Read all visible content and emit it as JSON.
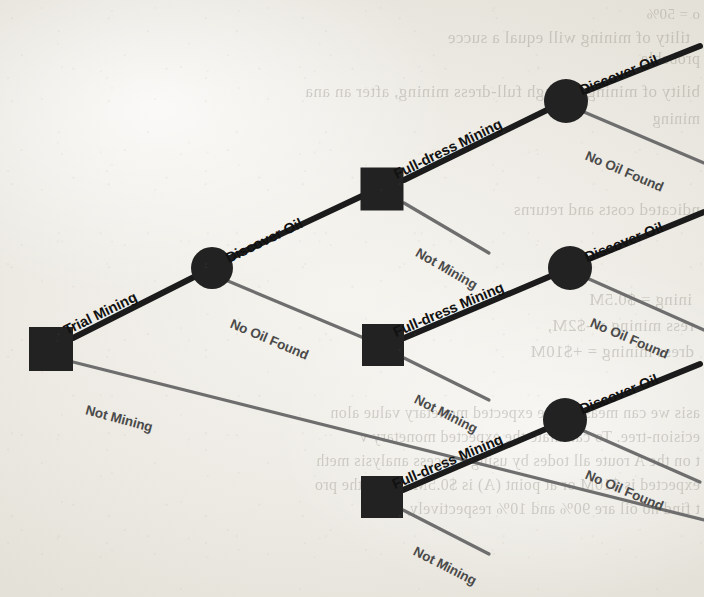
{
  "figure": {
    "type": "decision-tree",
    "medium": "scanned-book-page",
    "background_color": "#efece6",
    "bold_line_color": "#1b1b1b",
    "light_line_color": "#6e6e6e",
    "node_color": "#222222"
  },
  "labels": {
    "trial_mining": "Trial Mining",
    "not_mining": "Not Mining",
    "full_dress_mining": "Full-dress Mining",
    "discover_oil": "Discover Oil",
    "no_oil_found": "No Oil Found"
  },
  "nodes": [
    {
      "id": "root",
      "kind": "decision",
      "shape": "square",
      "x": 51,
      "y": 349,
      "size": 44
    },
    {
      "id": "chance1",
      "kind": "chance",
      "shape": "circle",
      "x": 212,
      "y": 268,
      "r": 21
    },
    {
      "id": "decisionA",
      "kind": "decision",
      "shape": "square",
      "x": 382,
      "y": 189,
      "size": 43
    },
    {
      "id": "decisionB",
      "kind": "decision",
      "shape": "square",
      "x": 383,
      "y": 345,
      "size": 42
    },
    {
      "id": "decisionC",
      "kind": "decision",
      "shape": "square",
      "x": 382,
      "y": 497,
      "size": 42
    },
    {
      "id": "chanceA",
      "kind": "chance",
      "shape": "circle",
      "x": 566,
      "y": 101,
      "r": 22
    },
    {
      "id": "chanceB",
      "kind": "chance",
      "shape": "circle",
      "x": 570,
      "y": 268,
      "r": 22
    },
    {
      "id": "chanceC",
      "kind": "chance",
      "shape": "circle",
      "x": 565,
      "y": 420,
      "r": 22
    }
  ],
  "edges": [
    {
      "id": "e-root-trial",
      "label": "Trial Mining",
      "weight": "bold",
      "from": "root",
      "to": "chance1",
      "x1": 73,
      "y1": 338,
      "x2": 194,
      "y2": 277
    },
    {
      "id": "e-root-notmine",
      "label": "Not Mining",
      "weight": "light",
      "from": "root",
      "to": "terminal-root-not",
      "x1": 73,
      "y1": 362,
      "x2": 704,
      "y2": 520
    },
    {
      "id": "e-c1-discover",
      "label": "Discover Oil",
      "weight": "bold",
      "from": "chance1",
      "to": "decisionA",
      "x1": 230,
      "y1": 258,
      "x2": 362,
      "y2": 196
    },
    {
      "id": "e-c1-nooil",
      "label": "No Oil Found",
      "weight": "light",
      "from": "chance1",
      "to": "decisionB",
      "x1": 228,
      "y1": 281,
      "x2": 364,
      "y2": 338
    },
    {
      "id": "e-dA-full",
      "label": "Full-dress Mining",
      "weight": "bold",
      "from": "decisionA",
      "to": "chanceA",
      "x1": 404,
      "y1": 180,
      "x2": 547,
      "y2": 110
    },
    {
      "id": "e-dA-not",
      "label": "Not Mining",
      "weight": "light",
      "from": "decisionA",
      "to": "terminal-A-not",
      "x1": 404,
      "y1": 203,
      "x2": 489,
      "y2": 253
    },
    {
      "id": "e-dB-full",
      "label": "Full-dress Mining",
      "weight": "bold",
      "from": "decisionB",
      "to": "chanceB",
      "x1": 404,
      "y1": 338,
      "x2": 551,
      "y2": 276
    },
    {
      "id": "e-dB-not",
      "label": "Not Mining",
      "weight": "light",
      "from": "decisionB",
      "to": "terminal-B-not",
      "x1": 404,
      "y1": 358,
      "x2": 489,
      "y2": 400
    },
    {
      "id": "e-dC-full",
      "label": "Full-dress Mining",
      "weight": "bold",
      "from": "decisionC",
      "to": "chanceC",
      "x1": 403,
      "y1": 490,
      "x2": 546,
      "y2": 429
    },
    {
      "id": "e-dC-not",
      "label": "Not Mining",
      "weight": "light",
      "from": "decisionC",
      "to": "terminal-C-not",
      "x1": 403,
      "y1": 510,
      "x2": 489,
      "y2": 554
    },
    {
      "id": "e-cA-discover",
      "label": "Discover Oil",
      "weight": "bold",
      "from": "chanceA",
      "to": "terminal-A-oil",
      "x1": 584,
      "y1": 92,
      "x2": 700,
      "y2": 46
    },
    {
      "id": "e-cA-nooil",
      "label": "No Oil Found",
      "weight": "light",
      "from": "chanceA",
      "to": "terminal-A-nooil",
      "x1": 584,
      "y1": 112,
      "x2": 704,
      "y2": 163
    },
    {
      "id": "e-cB-discover",
      "label": "Discover Oil",
      "weight": "bold",
      "from": "chanceB",
      "to": "terminal-B-oil",
      "x1": 589,
      "y1": 259,
      "x2": 704,
      "y2": 212
    },
    {
      "id": "e-cB-nooil",
      "label": "No Oil Found",
      "weight": "light",
      "from": "chanceB",
      "to": "terminal-B-nooil",
      "x1": 589,
      "y1": 279,
      "x2": 704,
      "y2": 330
    },
    {
      "id": "e-cC-discover",
      "label": "Discover Oil",
      "weight": "bold",
      "from": "chanceC",
      "to": "terminal-C-oil",
      "x1": 584,
      "y1": 411,
      "x2": 700,
      "y2": 364
    },
    {
      "id": "e-cC-nooil",
      "label": "No Oil Found",
      "weight": "light",
      "from": "chanceC",
      "to": "terminal-C-nooil",
      "x1": 584,
      "y1": 431,
      "x2": 700,
      "y2": 482
    }
  ],
  "bleed_through": [
    {
      "text": "o = 50%",
      "x": 700,
      "y": 6,
      "size": 15
    },
    {
      "text": "tility of mining will equal a succe",
      "x": 690,
      "y": 28,
      "size": 17
    },
    {
      "text": "probable",
      "x": 700,
      "y": 50,
      "size": 16
    },
    {
      "text": "bility of mining through full-dress mining, after an ana",
      "x": 700,
      "y": 82,
      "size": 17
    },
    {
      "text": "mining",
      "x": 700,
      "y": 110,
      "size": 16
    },
    {
      "text": "ndicated costs and returns",
      "x": 700,
      "y": 200,
      "size": 17
    },
    {
      "text": "ining = $0.5M",
      "x": 692,
      "y": 290,
      "size": 17
    },
    {
      "text": "ress mining = -$2M,",
      "x": 694,
      "y": 316,
      "size": 17
    },
    {
      "text": "dress mining = +$10M",
      "x": 694,
      "y": 342,
      "size": 17
    },
    {
      "text": "asis we can measure the expected monetary value alon",
      "x": 700,
      "y": 404,
      "size": 16
    },
    {
      "text": "ecision-tree. To calculate the expected monetary v",
      "x": 700,
      "y": 428,
      "size": 16
    },
    {
      "text": "t on the A route all todes by using a recess analysis meth",
      "x": 700,
      "y": 452,
      "size": 16
    },
    {
      "text": "expected is $10M or at point (A) is $0.5M. Since the pro",
      "x": 700,
      "y": 476,
      "size": 16
    },
    {
      "text": "t find no oil are 90% and 10% respectively, the",
      "x": 700,
      "y": 500,
      "size": 16
    }
  ],
  "placed_labels": [
    {
      "id": "lbl-trial-mining",
      "text": "Trial Mining",
      "x": 68,
      "y": 322,
      "rot": -26,
      "weight": "bold"
    },
    {
      "id": "lbl-root-not-mining",
      "text": "Not Mining",
      "x": 84,
      "y": 402,
      "rot": 15,
      "weight": "light"
    },
    {
      "id": "lbl-c1-discover",
      "text": "Discover Oil",
      "x": 230,
      "y": 250,
      "rot": -26,
      "weight": "bold"
    },
    {
      "id": "lbl-c1-nooil",
      "text": "No Oil Found",
      "x": 228,
      "y": 315,
      "rot": 23,
      "weight": "light"
    },
    {
      "id": "lbl-dA-full",
      "text": "Full-dress Mining",
      "x": 398,
      "y": 166,
      "rot": -26,
      "weight": "bold"
    },
    {
      "id": "lbl-dA-not",
      "text": "Not Mining",
      "x": 413,
      "y": 243,
      "rot": 30,
      "weight": "light"
    },
    {
      "id": "lbl-dB-full",
      "text": "Full-dress Mining",
      "x": 397,
      "y": 324,
      "rot": -23,
      "weight": "bold"
    },
    {
      "id": "lbl-dB-not",
      "text": "Not Mining",
      "x": 412,
      "y": 390,
      "rot": 27,
      "weight": "light"
    },
    {
      "id": "lbl-dC-full",
      "text": "Full-dress Mining",
      "x": 396,
      "y": 476,
      "rot": -23,
      "weight": "bold"
    },
    {
      "id": "lbl-dC-not",
      "text": "Not Mining",
      "x": 411,
      "y": 542,
      "rot": 27,
      "weight": "light"
    },
    {
      "id": "lbl-cA-discover",
      "text": "Discover Oil",
      "x": 583,
      "y": 82,
      "rot": -22,
      "weight": "bold"
    },
    {
      "id": "lbl-cA-nooil",
      "text": "No Oil Found",
      "x": 583,
      "y": 147,
      "rot": 23,
      "weight": "light"
    },
    {
      "id": "lbl-cB-discover",
      "text": "Discover Oil",
      "x": 588,
      "y": 249,
      "rot": -22,
      "weight": "bold"
    },
    {
      "id": "lbl-cB-nooil",
      "text": "No Oil Found",
      "x": 588,
      "y": 314,
      "rot": 23,
      "weight": "light"
    },
    {
      "id": "lbl-cC-discover",
      "text": "Discover Oil",
      "x": 583,
      "y": 401,
      "rot": -22,
      "weight": "bold"
    },
    {
      "id": "lbl-cC-nooil",
      "text": "No Oil Found",
      "x": 583,
      "y": 466,
      "rot": 23,
      "weight": "light"
    }
  ]
}
